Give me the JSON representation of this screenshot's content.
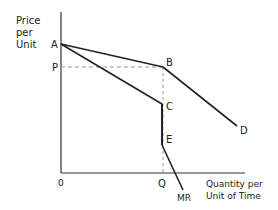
{
  "diagram": {
    "type": "kinked-demand-curve",
    "y_axis_label": [
      "Price",
      "per",
      "Unit"
    ],
    "x_axis_label": [
      "Quantity per",
      "Unit of Time"
    ],
    "origin_label": "0",
    "price_label": "P",
    "quantity_label": "Q",
    "points": {
      "A": "A",
      "B": "B",
      "C": "C",
      "D": "D",
      "E": "E"
    },
    "curve_labels": {
      "mr": "MR"
    },
    "segments": [
      {
        "name": "demand-AB",
        "from": "A",
        "to": "B",
        "style": "solid"
      },
      {
        "name": "demand-BD",
        "from": "B",
        "to": "D",
        "style": "solid"
      },
      {
        "name": "mr-AC",
        "from": "A",
        "to": "C",
        "style": "solid"
      },
      {
        "name": "mr-CE-gap",
        "from": "C",
        "to": "E",
        "style": "solid"
      },
      {
        "name": "mr-E-down",
        "from": "E",
        "to": "MR",
        "style": "solid"
      },
      {
        "name": "price-guide",
        "from": "P",
        "to": "B",
        "style": "dashed"
      },
      {
        "name": "quantity-guide",
        "from": "B",
        "to": "Q",
        "style": "dashed"
      }
    ],
    "colors": {
      "line": "#222222",
      "guide": "#999999"
    }
  }
}
